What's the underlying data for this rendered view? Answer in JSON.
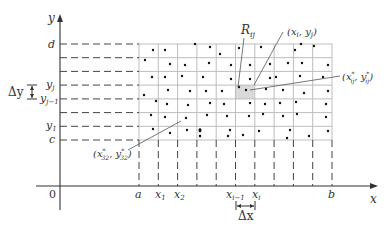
{
  "axes": {
    "x_label": "x",
    "y_label": "y",
    "origin_label": "0"
  },
  "x_ticks": [
    {
      "label": "a",
      "sub": ""
    },
    {
      "label": "x",
      "sub": "1"
    },
    {
      "label": "x",
      "sub": "2"
    },
    {
      "label": "x",
      "sub": "i−1"
    },
    {
      "label": "x",
      "sub": "i"
    },
    {
      "label": "b",
      "sub": ""
    }
  ],
  "y_ticks": [
    {
      "label": "d",
      "sub": ""
    },
    {
      "label": "y",
      "sub": "j"
    },
    {
      "label": "y",
      "sub": "j−1"
    },
    {
      "label": "y",
      "sub": "1"
    },
    {
      "label": "c",
      "sub": ""
    }
  ],
  "annotations": {
    "rect_label": "R",
    "rect_sub": "ij",
    "corner_point": "(x",
    "corner_point_i": "i",
    "corner_point_mid": ", y",
    "corner_point_j": "j",
    "corner_point_end": ")",
    "sample_point": "(x*ij, y*ij)",
    "sample_point_32": "(x*32, y*32)",
    "delta_x": "Δx",
    "delta_y": "Δy"
  },
  "grid": {
    "columns": 10,
    "rows": 7,
    "line_color": "#bdbdbd",
    "highlight_color": "#d9d9d9"
  }
}
